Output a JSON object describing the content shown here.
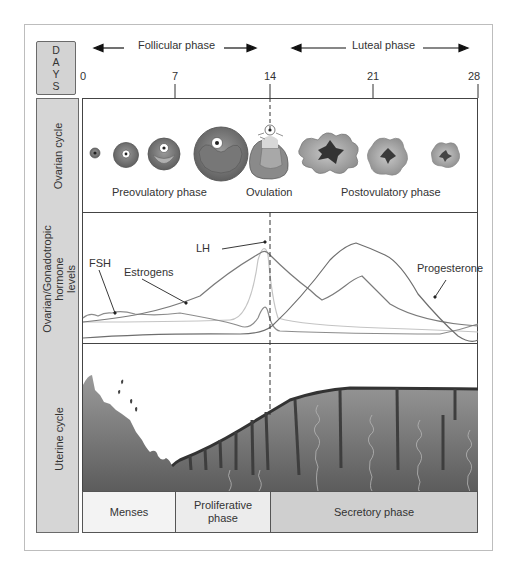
{
  "figure": {
    "days_label": [
      "D",
      "A",
      "Y",
      "S"
    ],
    "phase_headers": {
      "follicular": "Follicular phase",
      "luteal": "Luteal phase"
    },
    "day_ticks": [
      "0",
      "7",
      "14",
      "21",
      "28"
    ],
    "row_labels": {
      "ovarian": "Ovarian cycle",
      "hormone_line1": "Ovarian/Gonadotropic",
      "hormone_line2": "hormone",
      "hormone_line3": "levels",
      "uterine": "Uterine cycle"
    },
    "ovarian_labels": {
      "preovulatory": "Preovulatory phase",
      "ovulation": "Ovulation",
      "postovulatory": "Postovulatory phase"
    },
    "hormone_labels": {
      "fsh": "FSH",
      "estrogens": "Estrogens",
      "lh": "LH",
      "progesterone": "Progesterone"
    },
    "uterine_phases": {
      "menses": "Menses",
      "proliferative_line1": "Proliferative",
      "proliferative_line2": "phase",
      "secretory": "Secretory phase"
    },
    "colors": {
      "label_bg": "#d6d6d6",
      "secretory_bg": "#cfcfcf",
      "proliferative_bg": "#ececec",
      "menses_bg": "#f3f3f3",
      "line_dark": "#6e6e6e",
      "line_mid": "#8c8c8c",
      "line_light": "#c4c4c4"
    }
  }
}
